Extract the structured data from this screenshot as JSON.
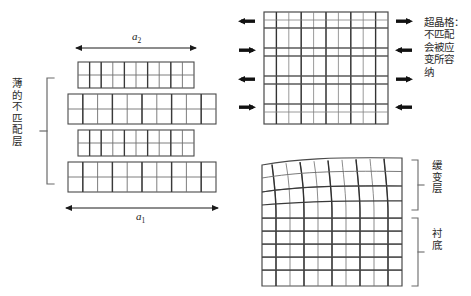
{
  "figure": {
    "background_color": "#ffffff",
    "line_color": "#3c3c3c",
    "text_color": "#2b2b2b",
    "width": 471,
    "height": 296
  },
  "labels": {
    "left_bracket_label": "薄的不匹配层",
    "left_bracket_label_chars": [
      "薄",
      "的",
      "不",
      "匹",
      "配",
      "层"
    ],
    "superlattice_label": "超晶格：\n不匹配\n会被应\n变所容\n纳",
    "superlattice_label_lines": [
      "超晶格：",
      "不匹配",
      "会被应",
      "变所容",
      "纳"
    ],
    "graded_layer_label": "缓变层",
    "graded_layer_label_chars": [
      "缓",
      "变",
      "层"
    ],
    "substrate_label": "衬底",
    "substrate_label_chars": [
      "衬",
      "底"
    ],
    "dimension_top": "a",
    "dimension_top_sub": "2",
    "dimension_bottom": "a",
    "dimension_bottom_sub": "1"
  },
  "layers": {
    "stack": [
      {
        "name": "layer-1",
        "lattice": "a2",
        "columns": 10,
        "rows": 2,
        "x": 78,
        "y": 62,
        "width": 116,
        "height": 26
      },
      {
        "name": "layer-2",
        "lattice": "a1",
        "columns": 10,
        "rows": 2,
        "x": 68,
        "y": 94,
        "width": 148,
        "height": 30
      },
      {
        "name": "layer-3",
        "lattice": "a2",
        "columns": 10,
        "rows": 2,
        "x": 78,
        "y": 130,
        "width": 116,
        "height": 26
      },
      {
        "name": "layer-4",
        "lattice": "a1",
        "columns": 10,
        "rows": 2,
        "x": 68,
        "y": 162,
        "width": 148,
        "height": 30
      }
    ]
  },
  "superlattice_block": {
    "name": "superlattice-grid",
    "columns": 10,
    "rows": 10,
    "x": 264,
    "y": 12,
    "width": 124,
    "height": 112,
    "arrows_left": [
      "out",
      "out",
      "out",
      "out"
    ],
    "arrows_right": [
      "out",
      "out",
      "out",
      "out"
    ],
    "arrow_count_per_side": 4
  },
  "graded_block": {
    "name": "graded-substrate-grid",
    "columns": 10,
    "rows": 10,
    "x": 262,
    "y": 158,
    "width": 140,
    "height": 128,
    "graded_rows": 3,
    "substrate_rows": 7
  },
  "icons": {
    "arrow_left": "arrow-left-icon",
    "arrow_right": "arrow-right-icon",
    "double_arrow": "double-headed-arrow-icon",
    "bracket": "curly-bracket-icon"
  }
}
